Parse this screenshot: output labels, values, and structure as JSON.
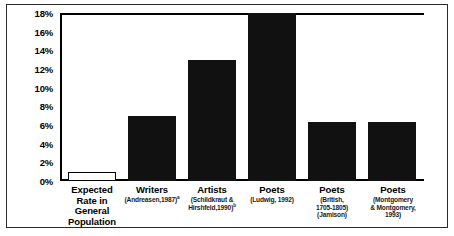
{
  "chart_data": {
    "type": "bar",
    "title": "",
    "xlabel": "",
    "ylabel": "",
    "ylim": [
      0,
      18
    ],
    "grid": false,
    "legend": null,
    "ytick_labels": [
      "18%",
      "16%",
      "14%",
      "12%",
      "10%",
      "8%",
      "6%",
      "4%",
      "2%",
      "0%"
    ],
    "ytick_values": [
      18,
      16,
      14,
      12,
      10,
      8,
      6,
      4,
      2,
      0
    ],
    "categories": [
      "Expected Rate in General Population",
      "Writers (Andreasen, 1987)",
      "Artists (Schildkraut & Hirshfeld, 1990)",
      "Poets (Ludwig, 1992)",
      "Poets (British, 1705-1805) (Jamison)",
      "Poets (Montgomery & Montgomery, 1993)"
    ],
    "values": [
      1.0,
      7.0,
      13.0,
      18.0,
      6.3,
      6.3
    ],
    "bars": [
      {
        "label_main": "Expected",
        "label_lines": [
          "Rate in",
          "General",
          "Population"
        ],
        "label_is_bold_stack": true,
        "citation": "",
        "superscript": "",
        "value": 1.0,
        "style": "hollow"
      },
      {
        "label_main": "Writers",
        "label_lines": [],
        "citation": "(Andreasen,1987)",
        "superscript": "a",
        "value": 7.0,
        "style": "filled"
      },
      {
        "label_main": "Artists",
        "label_lines": [],
        "citation": "(Schildkraut & Hirshfeld, 1990)",
        "superscript": "b",
        "value": 13.0,
        "style": "filled"
      },
      {
        "label_main": "Poets",
        "label_lines": [],
        "citation": "(Ludwig, 1992)",
        "superscript": "",
        "value": 18.0,
        "style": "filled"
      },
      {
        "label_main": "Poets",
        "label_lines": [],
        "citation": "(British, 1705-1805) (Jamison)",
        "superscript": "",
        "value": 6.3,
        "style": "filled"
      },
      {
        "label_main": "Poets",
        "label_lines": [],
        "citation": "(Montgomery & Montgomery, 1993)",
        "superscript": "",
        "value": 6.3,
        "style": "filled"
      }
    ]
  },
  "colors": {
    "bar_fill": "#111111",
    "bar_outline": "#000000",
    "axis": "#000000",
    "frame": "#2b2b2b",
    "background": "#ffffff"
  },
  "labels": {
    "y0": "18%",
    "y1": "16%",
    "y2": "14%",
    "y3": "12%",
    "y4": "10%",
    "y5": "8%",
    "y6": "6%",
    "y7": "4%",
    "y8": "2%",
    "y9": "0%",
    "b0_main": "Expected",
    "b0_l1": "Rate in",
    "b0_l2": "General",
    "b0_l3": "Population",
    "b1_main": "Writers",
    "b1_cite": "(Andreasen,1987)",
    "b1_sup": "a",
    "b2_main": "Artists",
    "b2_cite_l1": "(Schildkraut &",
    "b2_cite_l2": "Hirshfeld,1990)",
    "b2_sup": "b",
    "b3_main": "Poets",
    "b3_cite": "(Ludwig, 1992)",
    "b4_main": "Poets",
    "b4_cite_l1": "(British,",
    "b4_cite_l2": "1705-1805)",
    "b4_cite_l3": "(Jamison)",
    "b5_main": "Poets",
    "b5_cite_l1": "(Montgomery",
    "b5_cite_l2": "& Montgomery,",
    "b5_cite_l3": "1993)"
  }
}
